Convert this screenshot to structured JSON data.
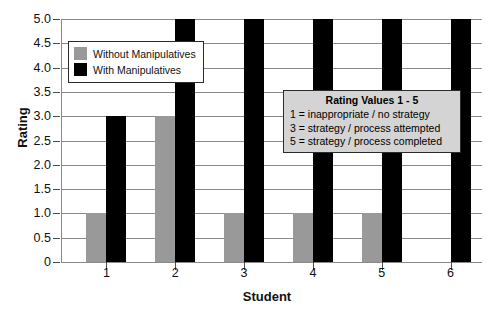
{
  "chart_data": {
    "type": "bar",
    "title": "",
    "xlabel": "Student",
    "ylabel": "Rating",
    "categories": [
      "1",
      "2",
      "3",
      "4",
      "5",
      "6"
    ],
    "series": [
      {
        "name": "Without Manipulatives",
        "color": "#999999",
        "values": [
          1.0,
          3.0,
          1.0,
          1.0,
          1.0,
          0
        ]
      },
      {
        "name": "With Manipulatives",
        "color": "#000000",
        "values": [
          3.0,
          5.0,
          5.0,
          5.0,
          5.0,
          5.0
        ]
      }
    ],
    "ylim": [
      0,
      5.0
    ],
    "ytick_values": [
      0,
      0.5,
      1.0,
      1.5,
      2.0,
      2.5,
      3.0,
      3.5,
      4.0,
      4.5,
      5.0
    ],
    "ytick_labels": [
      "0",
      "0.5",
      "1.0",
      "1.5",
      "2.0",
      "2.5",
      "3.0",
      "3.5",
      "4.0",
      "4.5",
      "5.0"
    ],
    "grid": true,
    "legend_position": "upper left"
  },
  "legend": {
    "items": [
      {
        "label": "Without Manipulatives"
      },
      {
        "label": "With Manipulatives"
      }
    ]
  },
  "annotation": {
    "title": "Rating Values 1 - 5",
    "lines": [
      "1 = inappropriate / no strategy",
      "3 = strategy / process attempted",
      "5 = strategy / process completed"
    ]
  },
  "colors": {
    "without": "#999999",
    "with": "#000000",
    "grid": "#8a8a8a",
    "annotation_bg": "#d4d4d4",
    "text": "#111111"
  }
}
